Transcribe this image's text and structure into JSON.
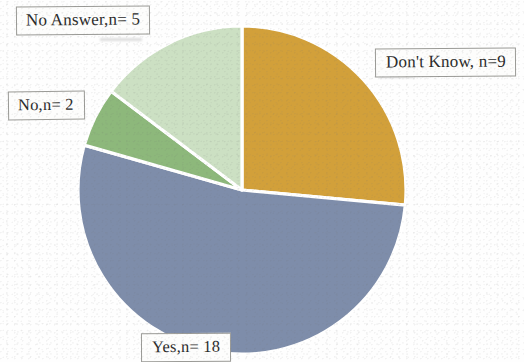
{
  "chart_data": {
    "type": "pie",
    "title": "",
    "subtitle": "",
    "xlabel": "",
    "ylabel": "",
    "legend_position": "none",
    "grid": false,
    "total": 34,
    "units": "responses",
    "start_angle_deg": 0,
    "direction": "clockwise",
    "categories": [
      "Don't Know",
      "Yes",
      "No",
      "No Answer"
    ],
    "values": [
      9,
      18,
      2,
      5
    ],
    "labels": [
      "Don't Know, n=9",
      "Yes,n= 18",
      "No,n= 2",
      "No Answer,n= 5"
    ],
    "colors": [
      "#D2A03A",
      "#7E8DAA",
      "#8DB87B",
      "#CCE0C3"
    ],
    "slices": [
      {
        "name": "Don't Know",
        "label": "Don't Know, n=9",
        "value": 9,
        "percent": 26.5,
        "angle_deg": 95.3,
        "color": "#D2A03A",
        "start_deg": 0,
        "end_deg": 95.3
      },
      {
        "name": "Yes",
        "label": "Yes,n= 18",
        "value": 18,
        "percent": 52.9,
        "angle_deg": 190.6,
        "color": "#7E8DAA",
        "start_deg": 95.3,
        "end_deg": 285.9
      },
      {
        "name": "No",
        "label": "No,n= 2",
        "value": 2,
        "percent": 5.9,
        "angle_deg": 21.2,
        "color": "#8DB87B",
        "start_deg": 285.9,
        "end_deg": 307.1
      },
      {
        "name": "No Answer",
        "label": "No Answer,n= 5",
        "value": 5,
        "percent": 14.7,
        "angle_deg": 52.9,
        "color": "#CCE0C3",
        "start_deg": 307.1,
        "end_deg": 360
      }
    ]
  },
  "labels": {
    "no_answer": "No Answer,n= 5",
    "no": "No,n= 2",
    "dont_know": "Don't Know, n=9",
    "yes": "Yes,n= 18"
  },
  "style": {
    "background": "#fefefe",
    "slice_border": "#ffffff",
    "label_border": "#9a9a96",
    "label_background": "#fdfdfc",
    "text_color": "#2b2b2b"
  }
}
